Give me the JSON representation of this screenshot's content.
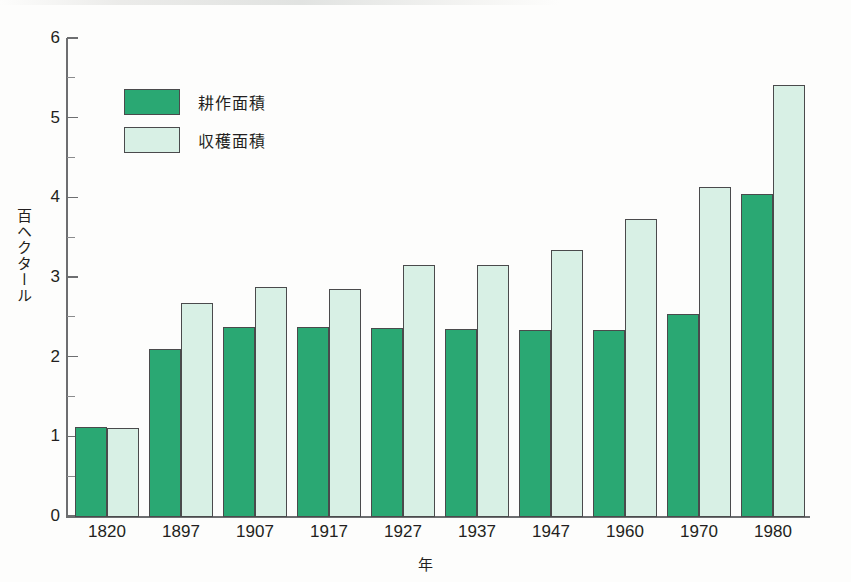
{
  "chart_data": {
    "type": "bar",
    "title": "",
    "subtitle": "",
    "xlabel": "年",
    "ylabel": "百ヘクタール",
    "categories": [
      "1820",
      "1897",
      "1907",
      "1917",
      "1927",
      "1937",
      "1947",
      "1960",
      "1970",
      "1980"
    ],
    "series": [
      {
        "name": "耕作面積",
        "color": "#2aa873",
        "values": [
          1.12,
          2.1,
          2.37,
          2.37,
          2.36,
          2.35,
          2.34,
          2.34,
          2.53,
          4.04
        ]
      },
      {
        "name": "収穫面積",
        "color": "#d8f0e5",
        "values": [
          1.1,
          2.67,
          2.88,
          2.85,
          3.15,
          3.15,
          3.34,
          3.73,
          4.13,
          5.41
        ]
      }
    ],
    "ylim": [
      0,
      6
    ],
    "y_major_ticks": [
      "0",
      "1",
      "2",
      "3",
      "4",
      "5",
      "6"
    ],
    "y_minor_ticks": [
      0.5,
      1.5,
      2.5,
      3.5,
      4.5,
      5.5
    ],
    "grid": false,
    "legend_position": "upper-left",
    "bar_outline_color": "#4a4a4c"
  },
  "legend": {
    "entries": [
      {
        "label": "耕作面積",
        "swatch": "cultivated"
      },
      {
        "label": "収穫面積",
        "swatch": "harvested"
      }
    ]
  },
  "axes": {
    "y_title": "百ヘクタール",
    "x_title": "年"
  }
}
